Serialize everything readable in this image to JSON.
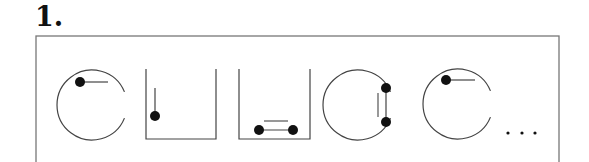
{
  "figure": {
    "label": "1.",
    "frame": {
      "x": 36,
      "y": 36,
      "width": 523,
      "height": 130,
      "stroke": "#777777"
    },
    "colors": {
      "stroke": "#444444",
      "ball": "#111111"
    },
    "panels": [
      {
        "type": "broken-circle",
        "cx": 92,
        "cy": 105,
        "r": 35,
        "balls": [
          {
            "x": 80,
            "y": 82
          }
        ],
        "sticks": [
          {
            "x1": 80,
            "y1": 82,
            "x2": 108,
            "y2": 82
          }
        ],
        "extra_lines": []
      },
      {
        "type": "container",
        "x1": 146,
        "x2": 216,
        "top": 69,
        "bottom": 139,
        "balls": [
          {
            "x": 155,
            "y": 116
          }
        ],
        "sticks": [
          {
            "x1": 155,
            "y1": 88,
            "x2": 155,
            "y2": 116
          }
        ],
        "extra_lines": []
      },
      {
        "type": "container",
        "x1": 239,
        "x2": 310,
        "top": 69,
        "bottom": 139,
        "balls": [
          {
            "x": 259,
            "y": 130
          },
          {
            "x": 293,
            "y": 130
          }
        ],
        "sticks": [
          {
            "x1": 259,
            "y1": 130,
            "x2": 293,
            "y2": 130
          }
        ],
        "extra_lines": [
          {
            "x1": 264,
            "y1": 121,
            "x2": 288,
            "y2": 121
          }
        ]
      },
      {
        "type": "broken-circle",
        "cx": 358,
        "cy": 105,
        "r": 35,
        "balls": [
          {
            "x": 386,
            "y": 88
          },
          {
            "x": 386,
            "y": 122
          }
        ],
        "sticks": [
          {
            "x1": 386,
            "y1": 88,
            "x2": 386,
            "y2": 122
          }
        ],
        "extra_lines": [
          {
            "x1": 378,
            "y1": 93,
            "x2": 378,
            "y2": 117
          }
        ]
      },
      {
        "type": "broken-circle",
        "cx": 458,
        "cy": 104,
        "r": 35,
        "balls": [
          {
            "x": 446,
            "y": 80
          }
        ],
        "sticks": [
          {
            "x1": 446,
            "y1": 80,
            "x2": 475,
            "y2": 80
          }
        ],
        "extra_lines": []
      }
    ],
    "ellipsis": {
      "text": "...",
      "dots": [
        {
          "x": 508,
          "y": 133
        },
        {
          "x": 522,
          "y": 133
        },
        {
          "x": 535,
          "y": 133
        }
      ]
    }
  }
}
